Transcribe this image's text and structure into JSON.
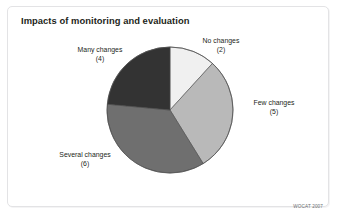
{
  "chart_data": {
    "type": "pie",
    "title": "Impacts of monitoring and evaluation",
    "xlabel": "",
    "ylabel": "",
    "total": 17,
    "legend_position": "outside-labels",
    "grid": false,
    "start_angle_deg": 0,
    "direction": "clockwise",
    "categories": [
      "No changes",
      "Few changes",
      "Several changes",
      "Many changes"
    ],
    "values": [
      2,
      5,
      6,
      4
    ],
    "slices": [
      {
        "label": "No changes",
        "count": 2,
        "count_text": "(2)",
        "color": "#f0f0f0",
        "start_deg": 0,
        "end_deg": 42.35,
        "label_position": "top-right"
      },
      {
        "label": "Few changes",
        "count": 5,
        "count_text": "(5)",
        "color": "#b9b9b9",
        "start_deg": 42.35,
        "end_deg": 148.24,
        "label_position": "right"
      },
      {
        "label": "Several changes",
        "count": 6,
        "count_text": "(6)",
        "color": "#6f6f6f",
        "start_deg": 148.24,
        "end_deg": 275.29,
        "label_position": "bottom-left"
      },
      {
        "label": "Many changes",
        "count": 4,
        "count_text": "(4)",
        "color": "#333333",
        "start_deg": 275.29,
        "end_deg": 360,
        "label_position": "top-left"
      }
    ]
  },
  "figure": {
    "title": "Impacts of monitoring and evaluation",
    "credit": "WOCAT 2007",
    "frame_color": "#e3e3e5",
    "text_color": "#231f20",
    "background": "#ffffff"
  }
}
